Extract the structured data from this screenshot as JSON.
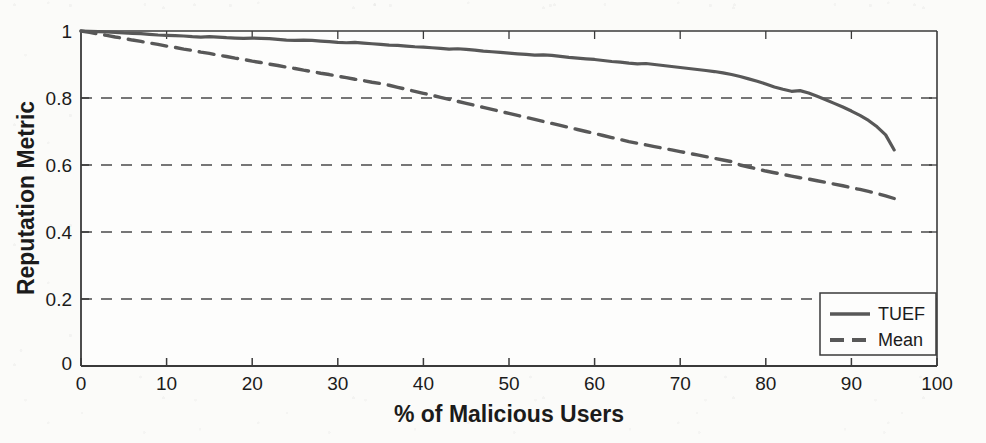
{
  "chart_data": {
    "type": "line",
    "title": "",
    "xlabel": "% of Malicious Users",
    "ylabel": "Reputation Metric",
    "xlim": [
      0,
      100
    ],
    "ylim": [
      0,
      1
    ],
    "xticks": [
      0,
      10,
      20,
      30,
      40,
      50,
      60,
      70,
      80,
      90,
      100
    ],
    "xticklabels": [
      "0",
      "10",
      "20",
      "30",
      "40",
      "50",
      "60",
      "70",
      "80",
      "90",
      "100"
    ],
    "yticks": [
      0,
      0.2,
      0.4,
      0.6,
      0.8,
      1
    ],
    "yticklabels": [
      "0",
      "0.2",
      "0.4",
      "0.6",
      "0.8",
      "1"
    ],
    "grid": "horizontal-dashed",
    "legend_position": "lower-right",
    "x": [
      0,
      1,
      2,
      3,
      4,
      5,
      6,
      7,
      8,
      9,
      10,
      11,
      12,
      13,
      14,
      15,
      16,
      17,
      18,
      19,
      20,
      21,
      22,
      23,
      24,
      25,
      26,
      27,
      28,
      29,
      30,
      31,
      32,
      33,
      34,
      35,
      36,
      37,
      38,
      39,
      40,
      41,
      42,
      43,
      44,
      45,
      46,
      47,
      48,
      49,
      50,
      51,
      52,
      53,
      54,
      55,
      56,
      57,
      58,
      59,
      60,
      61,
      62,
      63,
      64,
      65,
      66,
      67,
      68,
      69,
      70,
      71,
      72,
      73,
      74,
      75,
      76,
      77,
      78,
      79,
      80,
      81,
      82,
      83,
      84,
      85,
      86,
      87,
      88,
      89,
      90,
      91,
      92,
      93,
      94,
      95
    ],
    "series": [
      {
        "name": "TUEF",
        "style": "solid",
        "color": "#585858",
        "values": [
          1.0,
          0.999,
          0.998,
          0.997,
          0.996,
          0.994,
          0.993,
          0.992,
          0.99,
          0.988,
          0.987,
          0.986,
          0.985,
          0.983,
          0.982,
          0.983,
          0.982,
          0.98,
          0.979,
          0.978,
          0.979,
          0.978,
          0.977,
          0.975,
          0.973,
          0.972,
          0.973,
          0.972,
          0.97,
          0.968,
          0.966,
          0.965,
          0.966,
          0.964,
          0.962,
          0.96,
          0.958,
          0.957,
          0.955,
          0.953,
          0.952,
          0.95,
          0.948,
          0.946,
          0.947,
          0.945,
          0.943,
          0.94,
          0.938,
          0.936,
          0.934,
          0.932,
          0.93,
          0.928,
          0.929,
          0.927,
          0.924,
          0.921,
          0.919,
          0.917,
          0.915,
          0.912,
          0.909,
          0.907,
          0.904,
          0.902,
          0.903,
          0.9,
          0.897,
          0.894,
          0.891,
          0.888,
          0.885,
          0.882,
          0.879,
          0.875,
          0.87,
          0.864,
          0.857,
          0.85,
          0.842,
          0.833,
          0.826,
          0.82,
          0.822,
          0.815,
          0.805,
          0.795,
          0.784,
          0.773,
          0.761,
          0.748,
          0.733,
          0.714,
          0.69,
          0.645
        ]
      },
      {
        "name": "Mean",
        "style": "dashed",
        "color": "#585858",
        "values": [
          1.0,
          0.996,
          0.991,
          0.987,
          0.982,
          0.978,
          0.973,
          0.969,
          0.964,
          0.96,
          0.955,
          0.951,
          0.946,
          0.942,
          0.937,
          0.933,
          0.928,
          0.924,
          0.919,
          0.915,
          0.91,
          0.906,
          0.901,
          0.897,
          0.892,
          0.888,
          0.883,
          0.879,
          0.874,
          0.87,
          0.865,
          0.861,
          0.856,
          0.852,
          0.847,
          0.843,
          0.838,
          0.832,
          0.826,
          0.82,
          0.814,
          0.808,
          0.802,
          0.796,
          0.79,
          0.784,
          0.778,
          0.772,
          0.766,
          0.76,
          0.754,
          0.748,
          0.742,
          0.736,
          0.73,
          0.724,
          0.718,
          0.712,
          0.706,
          0.7,
          0.694,
          0.688,
          0.682,
          0.676,
          0.67,
          0.665,
          0.66,
          0.655,
          0.65,
          0.645,
          0.64,
          0.635,
          0.63,
          0.625,
          0.62,
          0.615,
          0.61,
          0.6,
          0.594,
          0.588,
          0.582,
          0.577,
          0.572,
          0.567,
          0.562,
          0.558,
          0.553,
          0.548,
          0.543,
          0.538,
          0.532,
          0.527,
          0.521,
          0.515,
          0.508,
          0.5
        ]
      }
    ]
  },
  "legend": {
    "entries": [
      {
        "label": "TUEF"
      },
      {
        "label": "Mean"
      }
    ]
  },
  "origin": {
    "y_zero_label": "0",
    "x_zero_label": "0"
  }
}
